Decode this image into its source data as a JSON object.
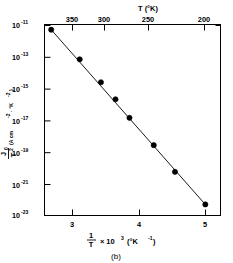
{
  "figure": {
    "caption": "(b)"
  },
  "chart_data": {
    "type": "scatter",
    "title": "",
    "subtitle": "",
    "xlabel_parts": {
      "numerator": "1",
      "denominator": "T",
      "times": "× 10",
      "times_exponent": "3",
      "units": "(°K",
      "units_exponent": "-1",
      "units_close": ")"
    },
    "xlabel": "1/T × 10³ (°K⁻¹)",
    "ylabel_parts": {
      "numerator": "J",
      "numerator_sub": "0",
      "denominator": "T",
      "denominator_sup": "2",
      "units_open": "(A cm",
      "units_exp1": "-2",
      "units_mid": "· °K",
      "units_exp2": "-2",
      "units_close": ")"
    },
    "ylabel": "J0/T² (A cm⁻² · °K⁻²)",
    "top_axis_label": "T (°K)",
    "xlim": [
      2.45,
      5.35
    ],
    "ylim_exp": [
      -23.6,
      -10.7
    ],
    "grid": false,
    "legend": null,
    "x_ticks": [
      {
        "value": 3,
        "label": "3"
      },
      {
        "value": 4,
        "label": "4"
      },
      {
        "value": 5,
        "label": "5"
      }
    ],
    "x_minor_ticks": [
      2.5,
      3.5,
      4.5,
      5.0
    ],
    "y_ticks": [
      {
        "exp": -11,
        "base": "10",
        "label": "-11"
      },
      {
        "exp": -13,
        "base": "10",
        "label": "-13"
      },
      {
        "exp": -15,
        "base": "10",
        "label": "-15"
      },
      {
        "exp": -17,
        "base": "10",
        "label": "-17"
      },
      {
        "exp": -19,
        "base": "10",
        "label": "-19"
      },
      {
        "exp": -21,
        "base": "10",
        "label": "-21"
      },
      {
        "exp": -23,
        "base": "10",
        "label": "-23"
      }
    ],
    "top_ticks": [
      {
        "temperature": 350,
        "label": "350",
        "inverse": 2.857
      },
      {
        "temperature": 300,
        "label": "300",
        "inverse": 3.333
      },
      {
        "temperature": 250,
        "label": "250",
        "inverse": 4.0
      },
      {
        "temperature": 200,
        "label": "200",
        "inverse": 5.0
      }
    ],
    "points": [
      {
        "x": 2.56,
        "y_exp": -11.05
      },
      {
        "x": 3.03,
        "y_exp": -13.05
      },
      {
        "x": 3.38,
        "y_exp": -14.6
      },
      {
        "x": 3.62,
        "y_exp": -15.75
      },
      {
        "x": 3.85,
        "y_exp": -17.0
      },
      {
        "x": 4.25,
        "y_exp": -18.85
      },
      {
        "x": 4.6,
        "y_exp": -20.65
      },
      {
        "x": 5.1,
        "y_exp": -22.85
      }
    ],
    "fit_line": {
      "x_start": 2.56,
      "y_exp_start": -11.05,
      "x_end": 5.12,
      "y_exp_end": -22.95
    }
  }
}
